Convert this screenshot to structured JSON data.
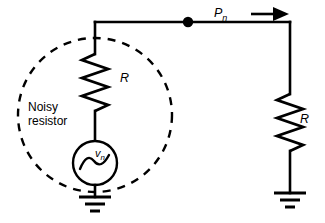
{
  "figure": {
    "type": "circuit-diagram",
    "background_color": "#ffffff",
    "line_color": "#000000"
  },
  "labels": {
    "noisy_resistor_line1": "Noisy",
    "noisy_resistor_line2": "resistor",
    "resistor_left": "R",
    "resistor_right": "R",
    "power_symbol": "P",
    "power_subscript": "n",
    "source_symbol": "v",
    "source_subscript": "n"
  },
  "components": [
    {
      "name": "noisy-resistor-boundary",
      "kind": "dashed-circle",
      "label": "Noisy resistor",
      "center": [
        95,
        115
      ],
      "radius": 77,
      "style": "dashed"
    },
    {
      "name": "source-resistor",
      "kind": "resistor",
      "label": "R",
      "orientation": "vertical",
      "x": 95,
      "y_top": 52,
      "y_bottom": 112,
      "peaks": 7
    },
    {
      "name": "noise-voltage-source",
      "kind": "ac-source",
      "label": "vn",
      "center": [
        95,
        163
      ],
      "radius": 22
    },
    {
      "name": "source-ground",
      "kind": "ground",
      "x": 95,
      "y": 196
    },
    {
      "name": "junction-node",
      "kind": "junction-dot",
      "x": 188,
      "y": 22,
      "radius": 5
    },
    {
      "name": "load-resistor",
      "kind": "resistor",
      "label": "R",
      "orientation": "vertical",
      "x": 290,
      "y_top": 92,
      "y_bottom": 152,
      "peaks": 7
    },
    {
      "name": "load-ground",
      "kind": "ground",
      "x": 290,
      "y": 192
    },
    {
      "name": "power-flow-arrow",
      "kind": "arrow",
      "label": "Pn",
      "direction": "right",
      "from": [
        250,
        14
      ],
      "to": [
        285,
        14
      ]
    }
  ],
  "wires": [
    {
      "name": "top-wire",
      "from": [
        95,
        22
      ],
      "to": [
        290,
        22
      ]
    },
    {
      "name": "source-top-lead",
      "from": [
        95,
        22
      ],
      "to": [
        95,
        52
      ]
    },
    {
      "name": "source-mid-lead",
      "from": [
        95,
        112
      ],
      "to": [
        95,
        141
      ]
    },
    {
      "name": "source-bottom-lead",
      "from": [
        95,
        185
      ],
      "to": [
        95,
        196
      ]
    },
    {
      "name": "load-top-lead",
      "from": [
        290,
        22
      ],
      "to": [
        290,
        92
      ]
    },
    {
      "name": "load-bottom-lead",
      "from": [
        290,
        152
      ],
      "to": [
        290,
        192
      ]
    }
  ]
}
